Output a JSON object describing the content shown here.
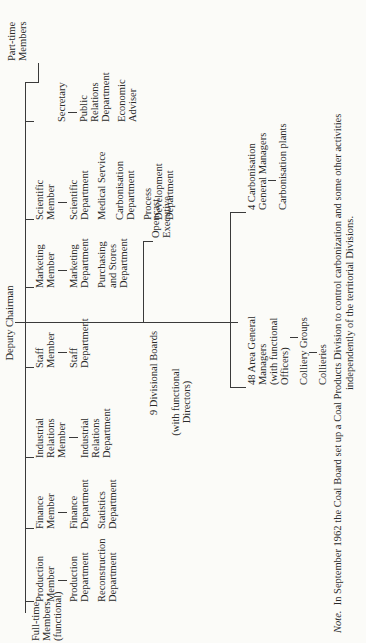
{
  "chart": {
    "top": "Deputy Chairman",
    "groups": {
      "full_time": "Full-time\nMembers\n(functional)",
      "part_time": "Part-time\nMembers"
    },
    "members": [
      {
        "name": "Production\nMember",
        "departments": [
          "Production\nDepartment",
          "Reconstruction\nDepartment"
        ]
      },
      {
        "name": "Finance\nMember",
        "departments": [
          "Finance\nDepartment",
          "Statistics\nDepartment"
        ]
      },
      {
        "name": "Industrial\nRelations\nMember",
        "departments": [
          "Industrial\nRelations\nDepartment"
        ]
      },
      {
        "name": "Staff\nMember",
        "departments": [
          "Staff\nDepartment"
        ]
      },
      {
        "name": "Marketing\nMember",
        "departments": [
          "Marketing\nDepartment",
          "Purchasing\nand Stores\nDepartment"
        ]
      },
      {
        "name": "Scientific\nMember",
        "departments": [
          "Scientific\nDepartment",
          "Medical Service",
          "Carbonisation\nDepartment",
          "Process\nDevelopment\nDepartment"
        ]
      }
    ],
    "secretary": {
      "name": "Secretary",
      "departments": [
        "Public\nRelations\nDepartment",
        "Economic\nAdviser"
      ]
    },
    "divisional": {
      "boards": "9 Divisional Boards",
      "boards_note": "(with functional\nDirectors)",
      "opencast": "Opencast\nExecutive",
      "area": "48 Area General\nManagers\n(with functional\nOfficers)",
      "groups": "Colliery Groups",
      "collieries": "Collieries",
      "carb_gm": "4 Carbonisation\nGeneral Managers",
      "carb_plants": "Carbonisation plants"
    }
  },
  "note": {
    "label": "Note.",
    "line1": "In September 1962 the Coal Board set up a Coal Products Division to control carbonization and some other activities",
    "line2": "independently of the territorial Divisions."
  }
}
